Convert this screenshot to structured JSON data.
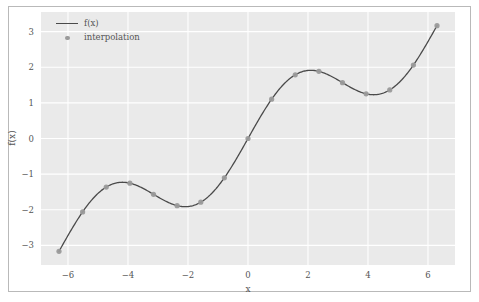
{
  "chart_data": {
    "type": "line",
    "title": "",
    "xlabel": "x",
    "ylabel": "f(x)",
    "xlim": [
      -6.9,
      6.9
    ],
    "ylim": [
      -3.55,
      3.55
    ],
    "grid": true,
    "legend_position": "upper left",
    "xticks": [
      -6,
      -4,
      -2,
      0,
      2,
      4,
      6
    ],
    "xtick_labels": [
      "−6",
      "−4",
      "−2",
      "0",
      "2",
      "4",
      "6"
    ],
    "yticks": [
      -3,
      -2,
      -1,
      0,
      1,
      2,
      3
    ],
    "ytick_labels": [
      "−3",
      "−2",
      "−1",
      "0",
      "1",
      "2",
      "3"
    ],
    "series": [
      {
        "name": "f(x)",
        "kind": "line",
        "color": "#4a4a4a",
        "x": [
          -6.3,
          -6.09,
          -5.88,
          -5.67,
          -5.46,
          -5.25,
          -5.04,
          -4.83,
          -4.62,
          -4.41,
          -4.2,
          -3.99,
          -3.78,
          -3.57,
          -3.36,
          -3.15,
          -2.94,
          -2.73,
          -2.52,
          -2.31,
          -2.1,
          -1.89,
          -1.68,
          -1.47,
          -1.26,
          -1.05,
          -0.84,
          -0.63,
          -0.42,
          -0.21,
          0,
          0.21,
          0.42,
          0.63,
          0.84,
          1.05,
          1.26,
          1.47,
          1.68,
          1.89,
          2.1,
          2.31,
          2.52,
          2.73,
          2.94,
          3.15,
          3.36,
          3.57,
          3.78,
          3.99,
          4.2,
          4.41,
          4.62,
          4.83,
          5.04,
          5.25,
          5.46,
          5.67,
          5.88,
          6.09,
          6.3
        ],
        "y": [
          -3.133,
          -2.897,
          -2.66,
          -2.426,
          -2.2,
          -2.187,
          -2.074,
          -1.98,
          -1.913,
          -1.163,
          -1.231,
          -1.247,
          -1.303,
          -1.369,
          -1.461,
          -1.577,
          -1.71,
          -1.751,
          -1.853,
          -1.894,
          -1.913,
          -1.894,
          -1.853,
          -1.751,
          -1.71,
          -1.577,
          -1.461,
          -1.369,
          -1.303,
          -1.247,
          0,
          0.313,
          0.617,
          0.904,
          1.165,
          1.392,
          1.582,
          1.73,
          1.834,
          1.894,
          1.913,
          1.894,
          1.834,
          1.73,
          1.582,
          1.392,
          1.165,
          0.904,
          0.617,
          0.313,
          1.3,
          1.32,
          1.38,
          1.52,
          1.7,
          1.95,
          2.25,
          2.55,
          2.8,
          3.0,
          3.133
        ]
      },
      {
        "name": "interpolation",
        "kind": "scatter",
        "color": "#9a9a9a",
        "x": [
          -6.3,
          -5.513,
          -4.725,
          -3.938,
          -3.15,
          -2.363,
          -1.575,
          -0.788,
          0,
          0.788,
          1.575,
          2.363,
          3.15,
          3.938,
          4.725,
          5.513,
          6.3
        ],
        "y": [
          -3.133,
          -2.043,
          -1.362,
          -1.206,
          -1.575,
          -2.0,
          -1.787,
          -1.102,
          0,
          1.102,
          1.787,
          2.0,
          1.575,
          1.206,
          1.362,
          2.043,
          3.133
        ]
      }
    ],
    "style": {
      "axes_facecolor": "#eaeaea",
      "grid_color": "#ffffff",
      "figure_facecolor": "#ffffff",
      "tick_color": "#555555"
    }
  },
  "legend": {
    "entries": [
      {
        "label": "f(x)",
        "marker": "line"
      },
      {
        "label": "interpolation",
        "marker": "dot"
      }
    ]
  }
}
